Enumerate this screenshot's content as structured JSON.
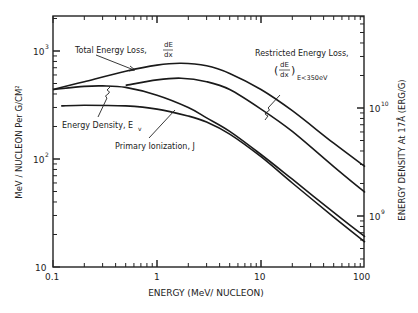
{
  "chart_data": {
    "type": "line",
    "title": "",
    "xlabel": "ENERGY (MeV/ NUCLEON)",
    "ylabel": "MeV / NUCLEON  Per G/CM²",
    "ylabel_right": "ENERGY DENSITY At 17Å (ERG/G)",
    "xscale": "log",
    "yscale": "log",
    "xlim": [
      0.1,
      100
    ],
    "ylim": [
      10,
      2000
    ],
    "x_ticks": [
      "0.1",
      "1",
      "10",
      "100"
    ],
    "y_ticks": [
      "10",
      "10²",
      "10³"
    ],
    "y_right_ticks": [
      "10⁹",
      "10¹⁰"
    ],
    "grid": false,
    "legend": "inline annotations",
    "series": [
      {
        "name": "Total Energy Loss, dE/dx",
        "x": [
          0.1,
          0.2,
          0.5,
          1,
          1.7,
          3,
          5,
          10,
          20,
          50,
          100
        ],
        "values": [
          440,
          520,
          650,
          740,
          770,
          730,
          620,
          440,
          280,
          140,
          85
        ]
      },
      {
        "name": "Restricted Energy Loss, (dE/dx) E<350eV",
        "x": [
          0.5,
          1,
          1.7,
          3,
          5,
          10,
          20,
          50,
          100
        ],
        "values": [
          480,
          540,
          560,
          520,
          440,
          290,
          180,
          85,
          49
        ]
      },
      {
        "name": "Energy Density, E_v",
        "x": [
          0.1,
          0.2,
          0.3,
          0.5,
          1,
          2,
          3,
          5,
          10,
          20,
          50,
          100
        ],
        "values": [
          440,
          470,
          475,
          460,
          390,
          300,
          240,
          180,
          110,
          65,
          32,
          19
        ]
      },
      {
        "name": "Primary Ionization, J",
        "x": [
          0.12,
          0.2,
          0.5,
          1,
          2,
          3,
          5,
          10,
          20,
          50,
          100
        ],
        "values": [
          310,
          315,
          310,
          290,
          250,
          220,
          170,
          105,
          60,
          29,
          17
        ]
      }
    ],
    "annotations": [
      {
        "text": "Total Energy Loss,",
        "frac": "dE/dx"
      },
      {
        "text": "Restricted Energy Loss,",
        "frac": "dE/dx",
        "sub": "E<350eV"
      },
      {
        "text": "Energy Density, E",
        "sub": "v"
      },
      {
        "text": "Primary Ionization, J"
      }
    ]
  },
  "labels": {
    "xlabel": "ENERGY (MeV/ NUCLEON)",
    "ylabel": "MeV / NUCLEON   Per G/CM²",
    "ylabel_right": "ENERGY DENSITY At 17Å (ERG/G)",
    "x0": "0.1",
    "x1": "1",
    "x2": "10",
    "x3": "100",
    "y10": "10",
    "y100base": "10",
    "y100exp": "2",
    "y1000base": "10",
    "y1000exp": "3",
    "r9base": "10",
    "r9exp": "9",
    "r10base": "10",
    "r10exp": "10",
    "total": "Total Energy Loss,",
    "restricted": "Restricted Energy Loss,",
    "restricted_sub": "E<350eV",
    "density": "Energy Density, E",
    "density_sub": "v",
    "primary": "Primary Ionization, J",
    "dE": "dE",
    "dx": "dx"
  }
}
